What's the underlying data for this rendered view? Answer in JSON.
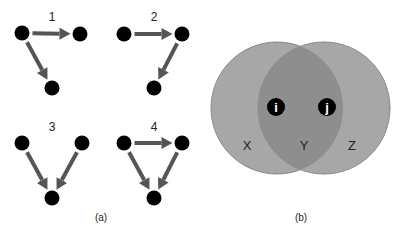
{
  "panel_a": {
    "caption": "(a)",
    "motifs": [
      {
        "label": "1",
        "label_pos": [
          52,
          17
        ],
        "nodes": [
          [
            22,
            33
          ],
          [
            80,
            34
          ],
          [
            52,
            88
          ]
        ],
        "edges": [
          [
            0,
            1
          ],
          [
            0,
            2
          ]
        ]
      },
      {
        "label": "2",
        "label_pos": [
          154,
          17
        ],
        "nodes": [
          [
            124,
            34
          ],
          [
            182,
            34
          ],
          [
            154,
            88
          ]
        ],
        "edges": [
          [
            0,
            1
          ],
          [
            1,
            2
          ]
        ]
      },
      {
        "label": "3",
        "label_pos": [
          52,
          127
        ],
        "nodes": [
          [
            22,
            143
          ],
          [
            82,
            143
          ],
          [
            52,
            198
          ]
        ],
        "edges": [
          [
            0,
            2
          ],
          [
            1,
            2
          ]
        ]
      },
      {
        "label": "4",
        "label_pos": [
          154,
          127
        ],
        "nodes": [
          [
            124,
            143
          ],
          [
            182,
            143
          ],
          [
            154,
            198
          ]
        ],
        "edges": [
          [
            0,
            1
          ],
          [
            0,
            2
          ],
          [
            1,
            2
          ]
        ]
      }
    ]
  },
  "panel_b": {
    "caption": "(b)",
    "regions": {
      "left": "X",
      "middle": "Y",
      "right": "Z"
    },
    "nodes": {
      "left": "i",
      "right": "j"
    },
    "colors": {
      "circle": "#a7a7a7",
      "overlap": "#8e8e8e",
      "stroke": "#8a8a8a",
      "node": "#000000"
    }
  },
  "colors": {
    "arrow": "#555555",
    "node": "#000000"
  }
}
